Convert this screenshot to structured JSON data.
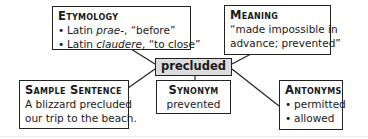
{
  "center": {
    "word": "precluded"
  },
  "etymology": {
    "heading": "Etymology",
    "items": [
      {
        "prefix": "Latin ",
        "italic": "prae-",
        "suffix": ", “before”"
      },
      {
        "prefix": "Latin ",
        "italic": "claudere",
        "suffix": ", “to close”"
      }
    ]
  },
  "meaning": {
    "heading": "Meaning",
    "lines": [
      "“made impossible in",
      "advance; prevented”"
    ]
  },
  "sample_sentence": {
    "heading": "Sample Sentence",
    "lines": [
      "A blizzard precluded",
      "our trip to the beach."
    ]
  },
  "synonym": {
    "heading": "Synonym",
    "value": "prevented"
  },
  "antonyms": {
    "heading": "Antonyms",
    "items": [
      "permitted",
      "allowed"
    ]
  },
  "icons": {
    "bullet": "•"
  },
  "colors": {
    "center_fill": "#dcdcdc",
    "border": "#222222"
  }
}
